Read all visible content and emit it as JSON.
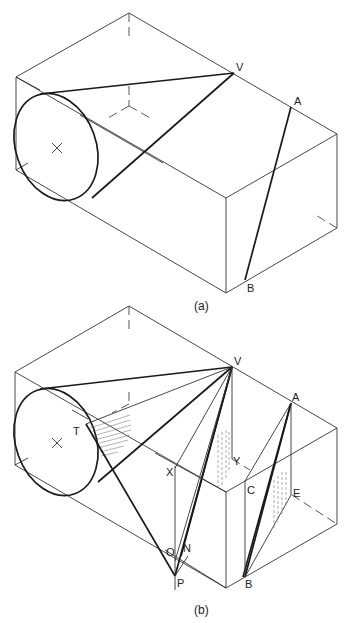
{
  "figure_a": {
    "caption": "(a)",
    "labels": {
      "V": "V",
      "A": "A",
      "B": "B"
    }
  },
  "figure_b": {
    "caption": "(b)",
    "labels": {
      "V": "V",
      "A": "A",
      "B": "B",
      "T": "T",
      "X": "X",
      "Y": "Y",
      "C": "C",
      "E": "E",
      "O": "O",
      "N": "N",
      "P": "P"
    }
  }
}
